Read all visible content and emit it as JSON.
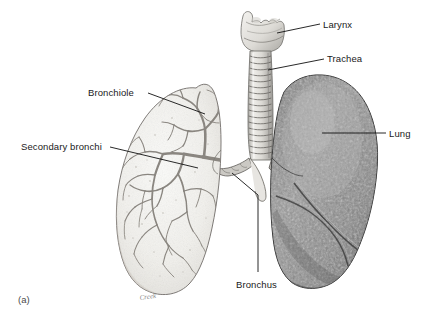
{
  "figure": {
    "letter": "(a)",
    "signature": "Creek",
    "background_color": "#ffffff",
    "text_color": "#1a1a1a"
  },
  "labels": {
    "larynx": "Larynx",
    "trachea": "Trachea",
    "lung": "Lung",
    "bronchiole": "Bronchiole",
    "secondary_bronchi": "Secondary bronchi",
    "bronchus": "Bronchus"
  },
  "anatomy": {
    "left_lung": {
      "name": "Left lung (cutaway, bronchial tree visible)",
      "fill": "#f2f1ee",
      "outline": "#6e6a66"
    },
    "right_lung": {
      "name": "Right lung (surface view, three lobes)",
      "fill": "#8d8d8d",
      "outline": "#3a3a3a"
    },
    "trachea": {
      "name": "Trachea with cartilage rings",
      "ring_count": 18,
      "fill": "#dededa"
    },
    "larynx": {
      "name": "Larynx",
      "fill": "#e8e7e3"
    },
    "bronchial_tree": {
      "name": "Bronchial tree branching",
      "stroke": "#8a8680"
    }
  }
}
